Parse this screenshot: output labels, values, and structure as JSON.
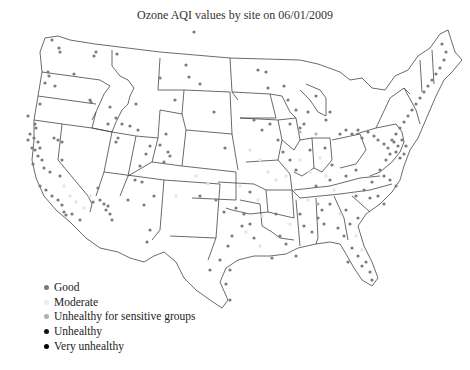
{
  "title": "Ozone AQI values by site on 06/01/2009",
  "legend": [
    {
      "label": "Good",
      "color": "#7a7a7a"
    },
    {
      "label": "Moderate",
      "color": "#ececec"
    },
    {
      "label": "Unhealthy for sensitive groups",
      "color": "#b0b0b0"
    },
    {
      "label": "Unhealthy",
      "color": "#111111"
    },
    {
      "label": "Very unhealthy",
      "color": "#000000"
    }
  ],
  "map": {
    "region": "Contiguous United States",
    "boundary_color": "#444444",
    "marker_good_color": "#7a7a7a",
    "marker_moderate_color": "#e6e6e6"
  }
}
